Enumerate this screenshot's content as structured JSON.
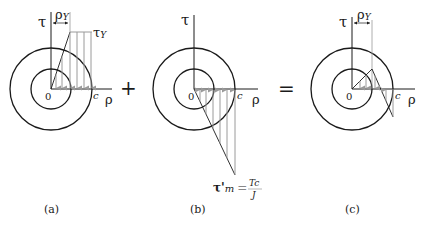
{
  "panels": [
    {
      "id": "a",
      "caption": "(a)",
      "tau_label": "τ",
      "rho_label": "ρ",
      "origin_label": "0",
      "c_label": "c",
      "rho_y_label": "ρ",
      "rho_y_sub": "Y",
      "tau_y_label": "τ",
      "tau_y_sub": "Y",
      "description": "Elastic-plastic shear stress distribution on loading"
    },
    {
      "id": "b",
      "caption": "(b)",
      "tau_label": "τ",
      "rho_label": "ρ",
      "origin_label": "0",
      "c_label": "c",
      "tau_m_label": "τ'",
      "tau_m_sub": "m",
      "equals": "=",
      "frac_num": "Tc",
      "frac_den": "J",
      "description": "Elastic unloading stress distribution"
    },
    {
      "id": "c",
      "caption": "(c)",
      "tau_label": "τ",
      "rho_label": "ρ",
      "origin_label": "0",
      "c_label": "c",
      "rho_y_label": "ρ",
      "rho_y_sub": "Y",
      "description": "Residual stress distribution"
    }
  ],
  "operators": {
    "plus": "+",
    "equals": "="
  }
}
